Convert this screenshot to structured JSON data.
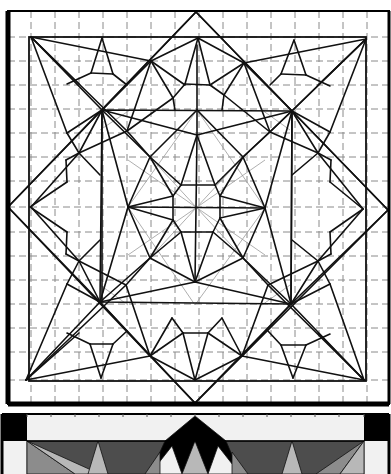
{
  "colors": {
    "line": "#111111",
    "grid": "#8a8a8a",
    "black": "#000000",
    "dark_gray": "#4d4d4d",
    "mid_gray": "#8c8c8c",
    "light_gray": "#b8b8b8",
    "near_white": "#f1f1f1"
  },
  "outer_frame": {
    "x1": 8,
    "y1": 11,
    "x2": 389,
    "y2": 404
  },
  "inner_frame": {
    "x1": 29,
    "y1": 37,
    "x2": 366,
    "y2": 381
  },
  "grid": {
    "verticals": [
      31,
      55,
      79,
      103,
      127,
      151,
      175,
      199,
      223,
      247,
      271,
      295,
      319,
      343,
      367
    ],
    "horizontals": [
      37,
      61,
      85,
      109,
      133,
      157,
      181,
      207,
      232,
      256,
      280,
      304,
      328,
      352,
      380
    ],
    "top": 11,
    "bottom": 404,
    "left": 8,
    "right": 389
  },
  "diamond": [
    [
      196,
      12
    ],
    [
      388,
      210
    ],
    [
      195,
      403
    ],
    [
      8,
      207
    ]
  ],
  "inner_square": [
    [
      102,
      110
    ],
    [
      292,
      111
    ],
    [
      291,
      304
    ],
    [
      100,
      302
    ]
  ],
  "lines": [
    [
      31,
      37,
      102,
      110
    ],
    [
      31,
      37,
      151,
      61
    ],
    [
      31,
      37,
      79,
      84
    ],
    [
      31,
      37,
      67,
      133
    ],
    [
      31,
      37,
      127,
      131
    ],
    [
      366,
      39,
      292,
      111
    ],
    [
      366,
      39,
      244,
      63
    ],
    [
      366,
      39,
      318,
      85
    ],
    [
      366,
      39,
      330,
      132
    ],
    [
      366,
      39,
      270,
      132
    ],
    [
      364,
      380,
      291,
      304
    ],
    [
      364,
      380,
      242,
      356
    ],
    [
      364,
      380,
      318,
      333
    ],
    [
      364,
      380,
      330,
      284
    ],
    [
      364,
      380,
      268,
      285
    ],
    [
      26,
      380,
      100,
      302
    ],
    [
      26,
      380,
      150,
      356
    ],
    [
      26,
      380,
      79,
      333
    ],
    [
      26,
      380,
      67,
      284
    ],
    [
      26,
      380,
      126,
      285
    ],
    [
      102,
      38,
      91,
      73
    ],
    [
      102,
      38,
      113,
      74
    ],
    [
      91,
      73,
      113,
      74
    ],
    [
      91,
      73,
      67,
      84
    ],
    [
      113,
      74,
      127,
      85
    ],
    [
      294,
      40,
      281,
      74
    ],
    [
      294,
      40,
      306,
      75
    ],
    [
      281,
      74,
      306,
      75
    ],
    [
      306,
      75,
      330,
      86
    ],
    [
      281,
      74,
      270,
      85
    ],
    [
      293,
      378,
      281,
      345
    ],
    [
      293,
      378,
      306,
      345
    ],
    [
      281,
      345,
      306,
      345
    ],
    [
      281,
      345,
      268,
      331
    ],
    [
      306,
      345,
      330,
      334
    ],
    [
      101,
      378,
      90,
      344
    ],
    [
      101,
      378,
      113,
      344
    ],
    [
      90,
      344,
      113,
      344
    ],
    [
      90,
      344,
      67,
      333
    ],
    [
      113,
      344,
      127,
      331
    ],
    [
      30,
      207,
      67,
      182
    ],
    [
      30,
      207,
      67,
      232
    ],
    [
      67,
      182,
      66,
      160
    ],
    [
      67,
      232,
      66,
      254
    ],
    [
      66,
      160,
      79,
      153
    ],
    [
      66,
      254,
      79,
      261
    ],
    [
      363,
      209,
      330,
      182
    ],
    [
      363,
      209,
      330,
      232
    ],
    [
      330,
      182,
      331,
      160
    ],
    [
      330,
      232,
      331,
      254
    ],
    [
      331,
      160,
      318,
      153
    ],
    [
      331,
      254,
      318,
      261
    ],
    [
      151,
      61,
      102,
      110
    ],
    [
      151,
      61,
      198,
      38
    ],
    [
      151,
      61,
      127,
      131
    ],
    [
      151,
      61,
      173,
      98
    ],
    [
      151,
      61,
      185,
      85
    ],
    [
      244,
      63,
      292,
      111
    ],
    [
      244,
      63,
      198,
      38
    ],
    [
      244,
      63,
      270,
      132
    ],
    [
      244,
      63,
      224,
      95
    ],
    [
      244,
      63,
      210,
      85
    ],
    [
      198,
      38,
      185,
      84
    ],
    [
      198,
      38,
      210,
      85
    ],
    [
      185,
      84,
      210,
      85
    ],
    [
      185,
      84,
      173,
      98
    ],
    [
      210,
      85,
      224,
      95
    ],
    [
      173,
      98,
      127,
      131
    ],
    [
      224,
      95,
      270,
      132
    ],
    [
      173,
      98,
      175,
      110
    ],
    [
      224,
      95,
      222,
      110
    ],
    [
      150,
      356,
      100,
      302
    ],
    [
      150,
      356,
      195,
      380
    ],
    [
      150,
      356,
      126,
      285
    ],
    [
      150,
      356,
      172,
      318
    ],
    [
      150,
      356,
      183,
      333
    ],
    [
      242,
      356,
      291,
      304
    ],
    [
      242,
      356,
      195,
      380
    ],
    [
      242,
      356,
      268,
      285
    ],
    [
      242,
      356,
      222,
      318
    ],
    [
      242,
      356,
      208,
      333
    ],
    [
      195,
      380,
      183,
      333
    ],
    [
      195,
      380,
      208,
      333
    ],
    [
      183,
      333,
      208,
      333
    ],
    [
      183,
      333,
      172,
      318
    ],
    [
      208,
      333,
      222,
      318
    ],
    [
      79,
      153,
      102,
      110
    ],
    [
      79,
      153,
      31,
      207
    ],
    [
      79,
      153,
      127,
      131
    ],
    [
      79,
      153,
      100,
      175
    ],
    [
      79,
      261,
      100,
      302
    ],
    [
      79,
      261,
      31,
      207
    ],
    [
      79,
      261,
      126,
      285
    ],
    [
      79,
      261,
      100,
      240
    ],
    [
      318,
      153,
      292,
      111
    ],
    [
      318,
      153,
      363,
      209
    ],
    [
      318,
      153,
      270,
      132
    ],
    [
      318,
      153,
      292,
      175
    ],
    [
      318,
      261,
      291,
      304
    ],
    [
      318,
      261,
      363,
      209
    ],
    [
      318,
      261,
      268,
      285
    ],
    [
      318,
      261,
      292,
      240
    ],
    [
      102,
      110,
      128,
      207
    ],
    [
      102,
      110,
      150,
      157
    ],
    [
      102,
      110,
      197,
      135
    ],
    [
      292,
      111,
      265,
      208
    ],
    [
      292,
      111,
      243,
      157
    ],
    [
      292,
      111,
      197,
      135
    ],
    [
      291,
      304,
      265,
      208
    ],
    [
      291,
      304,
      243,
      258
    ],
    [
      291,
      304,
      195,
      282
    ],
    [
      100,
      302,
      128,
      207
    ],
    [
      100,
      302,
      150,
      258
    ],
    [
      100,
      302,
      195,
      282
    ],
    [
      197,
      45,
      197,
      135
    ],
    [
      197,
      110,
      150,
      157
    ],
    [
      197,
      110,
      243,
      157
    ],
    [
      128,
      207,
      150,
      157
    ],
    [
      128,
      207,
      150,
      258
    ],
    [
      265,
      208,
      243,
      157
    ],
    [
      265,
      208,
      243,
      258
    ],
    [
      195,
      282,
      150,
      258
    ],
    [
      195,
      282,
      243,
      258
    ],
    [
      197,
      135,
      181,
      185
    ],
    [
      197,
      135,
      215,
      185
    ],
    [
      128,
      207,
      173,
      196
    ],
    [
      128,
      207,
      173,
      220
    ],
    [
      265,
      208,
      220,
      196
    ],
    [
      265,
      208,
      220,
      218
    ],
    [
      195,
      282,
      181,
      232
    ],
    [
      195,
      282,
      213,
      232
    ],
    [
      150,
      157,
      181,
      185
    ],
    [
      243,
      157,
      215,
      185
    ],
    [
      150,
      258,
      181,
      232
    ],
    [
      243,
      258,
      213,
      232
    ],
    [
      150,
      157,
      173,
      196
    ],
    [
      243,
      157,
      220,
      196
    ],
    [
      150,
      258,
      173,
      220
    ],
    [
      243,
      258,
      220,
      218
    ],
    [
      181,
      185,
      215,
      185
    ],
    [
      215,
      185,
      220,
      196
    ],
    [
      220,
      196,
      220,
      218
    ],
    [
      220,
      218,
      213,
      232
    ],
    [
      213,
      232,
      181,
      232
    ],
    [
      181,
      232,
      173,
      220
    ],
    [
      173,
      220,
      173,
      196
    ],
    [
      173,
      196,
      181,
      185
    ],
    [
      128,
      207,
      265,
      208
    ],
    [
      197,
      135,
      195,
      282
    ],
    [
      102,
      110,
      102,
      302
    ],
    [
      292,
      111,
      291,
      304
    ],
    [
      8,
      207,
      102,
      110
    ],
    [
      8,
      207,
      100,
      302
    ],
    [
      388,
      210,
      292,
      111
    ],
    [
      388,
      210,
      291,
      304
    ],
    [
      196,
      12,
      102,
      110
    ],
    [
      196,
      12,
      292,
      111
    ],
    [
      195,
      403,
      100,
      302
    ],
    [
      195,
      403,
      291,
      304
    ],
    [
      67,
      133,
      102,
      110
    ],
    [
      67,
      133,
      79,
      153
    ],
    [
      330,
      132,
      292,
      111
    ],
    [
      330,
      132,
      318,
      153
    ],
    [
      67,
      284,
      100,
      302
    ],
    [
      67,
      284,
      79,
      261
    ],
    [
      330,
      284,
      291,
      304
    ],
    [
      330,
      284,
      318,
      261
    ],
    [
      127,
      131,
      150,
      157
    ],
    [
      270,
      132,
      243,
      157
    ],
    [
      126,
      285,
      150,
      258
    ],
    [
      268,
      285,
      243,
      258
    ]
  ],
  "faint_lines": [
    [
      150,
      157,
      243,
      258
    ],
    [
      243,
      157,
      150,
      258
    ],
    [
      128,
      160,
      265,
      255
    ],
    [
      128,
      255,
      265,
      160
    ],
    [
      197,
      110,
      128,
      207
    ],
    [
      197,
      110,
      265,
      208
    ],
    [
      195,
      305,
      128,
      207
    ],
    [
      195,
      305,
      265,
      208
    ],
    [
      100,
      130,
      130,
      110
    ],
    [
      290,
      130,
      262,
      110
    ],
    [
      100,
      285,
      128,
      305
    ],
    [
      290,
      285,
      262,
      305
    ]
  ],
  "colored_panel": {
    "top": 414,
    "outer_frame": {
      "x1": 2,
      "y1": 414,
      "x2": 389,
      "y2": 474
    },
    "corner_squares": [
      {
        "x": 2,
        "y": 414,
        "w": 25,
        "h": 27,
        "color": "#000000"
      },
      {
        "x": 364,
        "y": 414,
        "w": 25,
        "h": 27,
        "color": "#000000"
      }
    ],
    "border_strip": {
      "color": "#f1f1f1"
    },
    "dark_band_y": 441,
    "polygons": [
      {
        "points": "27,441 364,441 364,474 27,474",
        "color": "#4d4d4d"
      },
      {
        "points": "27,441 75,474 27,474",
        "color": "#8c8c8c"
      },
      {
        "points": "27,441 100,474 75,474",
        "color": "#b8b8b8"
      },
      {
        "points": "98,441 88,474 108,474",
        "color": "#b8b8b8"
      },
      {
        "points": "292,441 282,474 302,474",
        "color": "#b8b8b8"
      },
      {
        "points": "364,441 316,474 340,474",
        "color": "#8c8c8c"
      },
      {
        "points": "364,441 340,474 364,474",
        "color": "#b8b8b8"
      },
      {
        "points": "195,416 165,441 150,474 240,474 226,441",
        "color": "#000000"
      },
      {
        "points": "172,446 150,474 182,474",
        "color": "#f1f1f1"
      },
      {
        "points": "218,446 208,474 240,474",
        "color": "#f1f1f1"
      },
      {
        "points": "195,441 182,474 208,474",
        "color": "#b8b8b8"
      },
      {
        "points": "160,452 145,474 160,474",
        "color": "#8c8c8c"
      },
      {
        "points": "232,452 232,474 248,474",
        "color": "#8c8c8c"
      }
    ],
    "ticks_x": [
      27,
      51,
      75,
      99,
      123,
      147,
      171,
      195,
      219,
      243,
      267,
      291,
      315,
      339,
      364
    ]
  }
}
